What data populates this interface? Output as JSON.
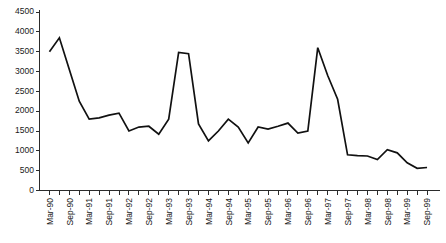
{
  "chart_data": {
    "type": "line",
    "title": "",
    "subtitle": "",
    "xlabel": "",
    "ylabel": "",
    "grid": false,
    "legend": false,
    "legend_position": "none",
    "line_color": "#111111",
    "axis_color": "#2b2b2b",
    "background": "#ffffff",
    "ylim": [
      0,
      4500
    ],
    "yticks": [
      0,
      500,
      1000,
      1500,
      2000,
      2500,
      3000,
      3500,
      4000,
      4500
    ],
    "ytick_labels": [
      "0",
      "500",
      "1000",
      "1500",
      "2000",
      "2500",
      "3000",
      "3500",
      "4000",
      "4500"
    ],
    "xtick_labels": [
      "Mar-90",
      "Sep-90",
      "Mar-91",
      "Sep-91",
      "Mar-92",
      "Sep-92",
      "Mar-93",
      "Sep-93",
      "Mar-94",
      "Sep-94",
      "Mar-95",
      "Sep-95",
      "Mar-96",
      "Sep-96",
      "Mar-97",
      "Sep-97",
      "Mar-98",
      "Sep-98",
      "Mar-99",
      "Sep-99"
    ],
    "x": [
      "Mar-90",
      "Jun-90",
      "Sep-90",
      "Dec-90",
      "Mar-91",
      "Jun-91",
      "Sep-91",
      "Dec-91",
      "Mar-92",
      "Jun-92",
      "Sep-92",
      "Dec-92",
      "Mar-93",
      "Jun-93",
      "Sep-93",
      "Dec-93",
      "Mar-94",
      "Jun-94",
      "Sep-94",
      "Dec-94",
      "Mar-95",
      "Jun-95",
      "Sep-95",
      "Dec-95",
      "Mar-96",
      "Jun-96",
      "Sep-96",
      "Dec-96",
      "Mar-97",
      "Jun-97",
      "Sep-97",
      "Dec-97",
      "Mar-98",
      "Jun-98",
      "Sep-98",
      "Dec-98",
      "Mar-99",
      "Jun-99",
      "Sep-99"
    ],
    "values": [
      3500,
      3850,
      3050,
      2250,
      1800,
      1830,
      1900,
      1950,
      1500,
      1600,
      1620,
      1420,
      1800,
      3480,
      3450,
      1680,
      1250,
      1500,
      1800,
      1600,
      1200,
      1600,
      1550,
      1620,
      1700,
      1450,
      1500,
      3600,
      2900,
      2300,
      900,
      880,
      870,
      780,
      1030,
      950,
      700,
      560,
      580
    ],
    "series": [
      {
        "name": "series-1",
        "values": [
          3500,
          3850,
          3050,
          2250,
          1800,
          1830,
          1900,
          1950,
          1500,
          1600,
          1620,
          1420,
          1800,
          3480,
          3450,
          1680,
          1250,
          1500,
          1800,
          1600,
          1200,
          1600,
          1550,
          1620,
          1700,
          1450,
          1500,
          3600,
          2900,
          2300,
          900,
          880,
          870,
          780,
          1030,
          950,
          700,
          560,
          580
        ]
      }
    ]
  }
}
